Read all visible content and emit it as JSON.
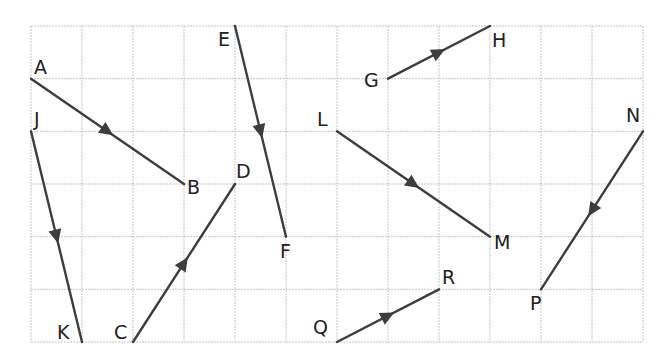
{
  "diagram": {
    "type": "vector-grid",
    "grid": {
      "columns": 12,
      "rows": 6,
      "origin_px": [
        31,
        26
      ],
      "cell_w": 51,
      "cell_h": 52.67,
      "line_color": "#c4c4c4"
    },
    "segment_color": "#3d3d3d",
    "segments": [
      {
        "id": "AB",
        "from": {
          "label": "A",
          "x": 0,
          "y": 1
        },
        "to": {
          "label": "B",
          "x": 3,
          "y": 3
        }
      },
      {
        "id": "JK",
        "from": {
          "label": "J",
          "x": 0,
          "y": 2
        },
        "to": {
          "label": "K",
          "x": 1,
          "y": 6
        }
      },
      {
        "id": "CD",
        "from": {
          "label": "C",
          "x": 2,
          "y": 6
        },
        "to": {
          "label": "D",
          "x": 4,
          "y": 3
        }
      },
      {
        "id": "EF",
        "from": {
          "label": "E",
          "x": 4,
          "y": 0
        },
        "to": {
          "label": "F",
          "x": 5,
          "y": 4
        }
      },
      {
        "id": "GH",
        "from": {
          "label": "G",
          "x": 7,
          "y": 1
        },
        "to": {
          "label": "H",
          "x": 9,
          "y": 0
        }
      },
      {
        "id": "LM",
        "from": {
          "label": "L",
          "x": 6,
          "y": 2
        },
        "to": {
          "label": "M",
          "x": 9,
          "y": 4
        }
      },
      {
        "id": "QR",
        "from": {
          "label": "Q",
          "x": 6,
          "y": 6
        },
        "to": {
          "label": "R",
          "x": 8,
          "y": 5
        }
      },
      {
        "id": "NP",
        "from": {
          "label": "N",
          "x": 12,
          "y": 2
        },
        "to": {
          "label": "P",
          "x": 10,
          "y": 5
        }
      }
    ],
    "labels": {
      "A": {
        "text": "A",
        "x": 34,
        "y": 74
      },
      "B": {
        "text": "B",
        "x": 187,
        "y": 194
      },
      "J": {
        "text": "J",
        "x": 34,
        "y": 126
      },
      "K": {
        "text": "K",
        "x": 57,
        "y": 339
      },
      "C": {
        "text": "C",
        "x": 114,
        "y": 339
      },
      "D": {
        "text": "D",
        "x": 236,
        "y": 178
      },
      "E": {
        "text": "E",
        "x": 218,
        "y": 46
      },
      "F": {
        "text": "F",
        "x": 280,
        "y": 258
      },
      "G": {
        "text": "G",
        "x": 364,
        "y": 87
      },
      "H": {
        "text": "H",
        "x": 492,
        "y": 47
      },
      "L": {
        "text": "L",
        "x": 317,
        "y": 126
      },
      "M": {
        "text": "M",
        "x": 494,
        "y": 249
      },
      "Q": {
        "text": "Q",
        "x": 313,
        "y": 334
      },
      "R": {
        "text": "R",
        "x": 442,
        "y": 284
      },
      "N": {
        "text": "N",
        "x": 626,
        "y": 122
      },
      "P": {
        "text": "P",
        "x": 530,
        "y": 310
      }
    }
  }
}
